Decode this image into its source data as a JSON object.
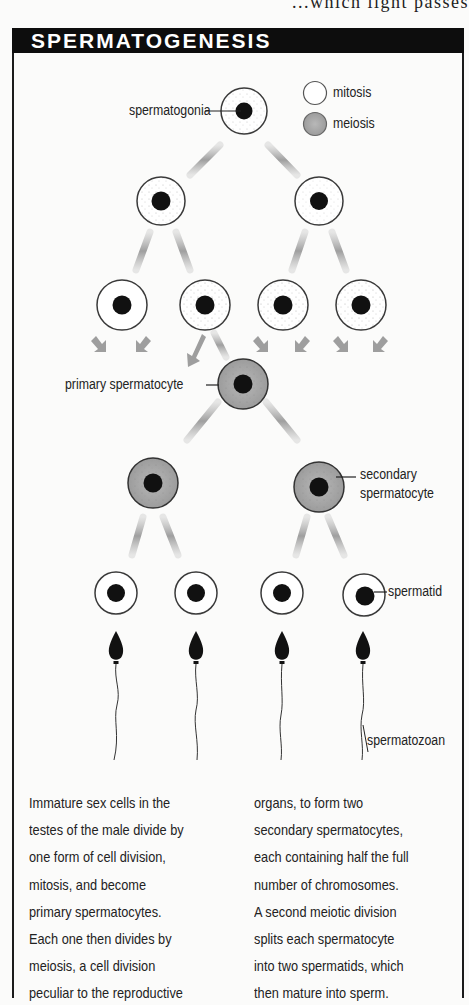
{
  "page": {
    "preceding_text_fragment": "...which light passes"
  },
  "figure": {
    "title": "SPERMATOGENESIS",
    "legend": [
      {
        "label": "mitosis",
        "fill": "#ffffff"
      },
      {
        "label": "meiosis",
        "fill": "#a9a9a9"
      }
    ],
    "labels": {
      "spermatogonia": "spermatogonia",
      "primary_spermatocyte": "primary spermatocyte",
      "secondary_spermatocyte_line1": "secondary",
      "secondary_spermatocyte_line2": "spermatocyte",
      "spermatid": "spermatid",
      "spermatozoan": "spermatozoan"
    },
    "stages": [
      {
        "name": "spermatogonia",
        "count": 1,
        "division": "mitosis"
      },
      {
        "name": "daughter cells (mitosis)",
        "count": 2,
        "division": "mitosis"
      },
      {
        "name": "daughter cells (mitosis)",
        "count": 4,
        "division": "mitosis"
      },
      {
        "name": "primary spermatocyte",
        "count": 1,
        "division": "meiosis"
      },
      {
        "name": "secondary spermatocyte",
        "count": 2,
        "division": "meiosis"
      },
      {
        "name": "spermatid",
        "count": 4,
        "division": "none"
      },
      {
        "name": "spermatozoan",
        "count": 4,
        "division": "none"
      }
    ],
    "colors": {
      "title_bar": "#0d0d0d",
      "mitosis_cell": "#ffffff",
      "meiosis_cell": "#a9a9a9",
      "nucleus": "#111111",
      "arrow": "#9a9a9a"
    }
  },
  "caption": {
    "left_column": [
      "Immature sex cells in the",
      "testes of the male divide by",
      "one form of cell division,",
      "mitosis, and become",
      "primary spermatocytes.",
      "Each one then divides by",
      "meiosis, a cell division",
      "peculiar to the reproductive"
    ],
    "right_column": [
      "organs, to form two",
      "secondary spermatocytes,",
      "each containing half the full",
      "number of chromosomes.",
      "A second meiotic division",
      "splits each spermatocyte",
      "into two spermatids, which",
      "then mature into sperm."
    ]
  }
}
